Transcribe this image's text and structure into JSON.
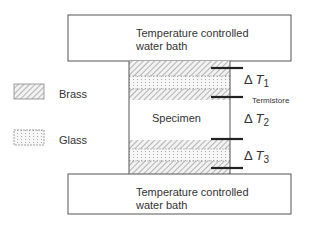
{
  "top_bath": {
    "line1": "Temperature controlled",
    "line2": "water bath"
  },
  "bottom_bath": {
    "line1": "Temperature controlled",
    "line2": "water bath"
  },
  "specimen_label": "Specimen",
  "legend": [
    {
      "label": "Brass",
      "pattern": "diagonal-hatch"
    },
    {
      "label": "Glass",
      "pattern": "dotted"
    }
  ],
  "thermistor_label": "Termistore",
  "deltas": [
    {
      "symbol": "Δ",
      "var": "T",
      "sub": "1"
    },
    {
      "symbol": "Δ",
      "var": "T",
      "sub": "2"
    },
    {
      "symbol": "Δ",
      "var": "T",
      "sub": "3"
    }
  ],
  "colors": {
    "line": "#555555",
    "thermistor": "#222222",
    "hatch": "#888888"
  }
}
